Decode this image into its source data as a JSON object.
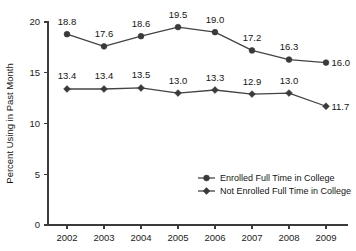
{
  "chart_data": {
    "type": "line",
    "title": "",
    "xlabel": "",
    "ylabel": "Percent Using in Past Month",
    "categories": [
      "2002",
      "2003",
      "2004",
      "2005",
      "2006",
      "2007",
      "2008",
      "2009"
    ],
    "x": [
      2002,
      2003,
      2004,
      2005,
      2006,
      2007,
      2008,
      2009
    ],
    "ylim": [
      0,
      20
    ],
    "yticks": [
      0,
      5,
      10,
      15,
      20
    ],
    "ytick_labels": [
      "0",
      "5",
      "10",
      "15",
      "20"
    ],
    "grid": false,
    "legend_position": "lower right",
    "series": [
      {
        "name": "Enrolled Full Time in College",
        "marker": "circle",
        "values": [
          18.8,
          17.6,
          18.6,
          19.5,
          19.0,
          17.2,
          16.3,
          16.0
        ],
        "labels": [
          "18.8",
          "17.6",
          "18.6",
          "19.5",
          "19.0",
          "17.2",
          "16.3",
          "16.0"
        ]
      },
      {
        "name": "Not Enrolled Full Time in College",
        "marker": "diamond",
        "values": [
          13.4,
          13.4,
          13.5,
          13.0,
          13.3,
          12.9,
          13.0,
          11.7
        ],
        "labels": [
          "13.4",
          "13.4",
          "13.5",
          "13.0",
          "13.3",
          "12.9",
          "13.0",
          "11.7"
        ]
      }
    ]
  },
  "legend": {
    "entries": [
      {
        "label": "Enrolled Full Time in College",
        "marker": "circle"
      },
      {
        "label": "Not Enrolled Full Time in College",
        "marker": "diamond"
      }
    ]
  },
  "colors": {
    "line": "#444444",
    "marker": "#3a3a3a",
    "axis": "#3b3b3b",
    "text": "#141414",
    "background": "#ffffff"
  }
}
